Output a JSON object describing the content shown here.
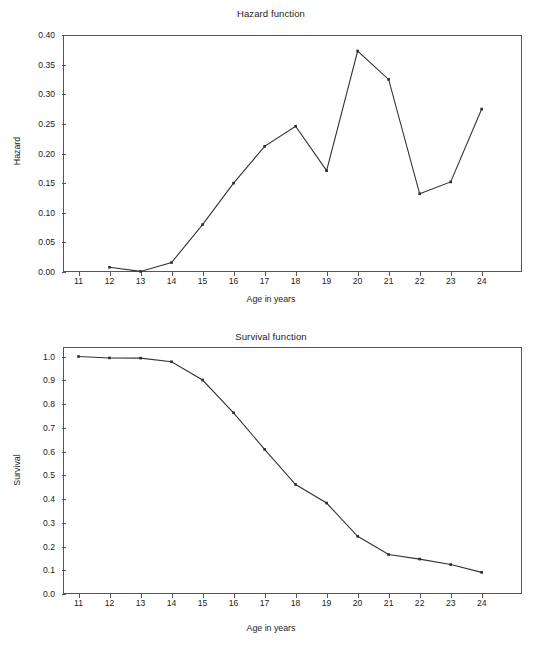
{
  "figure": {
    "panels": [
      "hazard",
      "survival"
    ]
  },
  "hazard": {
    "title": "Hazard function",
    "xlabel": "Age in years",
    "ylabel": "Hazard",
    "ytick_labels": [
      "0.40",
      "0.35",
      "0.30",
      "0.25",
      "0.20",
      "0.15",
      "0.10",
      "0.05",
      "0.00"
    ],
    "xtick_labels": [
      "11",
      "12",
      "13",
      "14",
      "15",
      "16",
      "17",
      "18",
      "19",
      "20",
      "21",
      "22",
      "23",
      "24"
    ]
  },
  "survival": {
    "title": "Survival function",
    "xlabel": "Age in years",
    "ylabel": "Survival",
    "ytick_labels": [
      "1.0",
      "0.9",
      "0.8",
      "0.7",
      "0.6",
      "0.5",
      "0.4",
      "0.3",
      "0.2",
      "0.1",
      "0.0"
    ],
    "xtick_labels": [
      "11",
      "12",
      "13",
      "14",
      "15",
      "16",
      "17",
      "18",
      "19",
      "20",
      "21",
      "22",
      "23",
      "24"
    ]
  },
  "colors": {
    "line": "#333333",
    "marker": "#2b2b2b",
    "axis": "#555555",
    "background": "#ffffff",
    "text": "#1b1b1b"
  },
  "chart_data": [
    {
      "type": "line",
      "title": "Hazard function",
      "xlabel": "Age in years",
      "ylabel": "Hazard",
      "xlim": [
        10.5,
        25.3
      ],
      "ylim": [
        0.0,
        0.4
      ],
      "xticks": [
        11,
        12,
        13,
        14,
        15,
        16,
        17,
        18,
        19,
        20,
        21,
        22,
        23,
        24
      ],
      "yticks": [
        0.0,
        0.05,
        0.1,
        0.15,
        0.2,
        0.25,
        0.3,
        0.35,
        0.4
      ],
      "grid": false,
      "legend": null,
      "x": [
        12,
        13,
        14,
        15,
        16,
        17,
        18,
        19,
        20,
        21,
        22,
        23,
        24
      ],
      "values": [
        0.008,
        0.001,
        0.016,
        0.08,
        0.15,
        0.212,
        0.246,
        0.171,
        0.373,
        0.325,
        0.132,
        0.152,
        0.275
      ]
    },
    {
      "type": "line",
      "title": "Survival function",
      "xlabel": "Age in years",
      "ylabel": "Survival",
      "xlim": [
        10.5,
        25.3
      ],
      "ylim": [
        0.0,
        1.04
      ],
      "xticks": [
        11,
        12,
        13,
        14,
        15,
        16,
        17,
        18,
        19,
        20,
        21,
        22,
        23,
        24
      ],
      "yticks": [
        0.0,
        0.1,
        0.2,
        0.3,
        0.4,
        0.5,
        0.6,
        0.7,
        0.8,
        0.9,
        1.0
      ],
      "grid": false,
      "legend": null,
      "x": [
        11,
        12,
        13,
        14,
        15,
        16,
        17,
        18,
        19,
        20,
        21,
        22,
        23,
        24
      ],
      "values": [
        1.0,
        0.994,
        0.993,
        0.978,
        0.901,
        0.763,
        0.609,
        0.461,
        0.383,
        0.243,
        0.166,
        0.147,
        0.124,
        0.091
      ]
    }
  ]
}
